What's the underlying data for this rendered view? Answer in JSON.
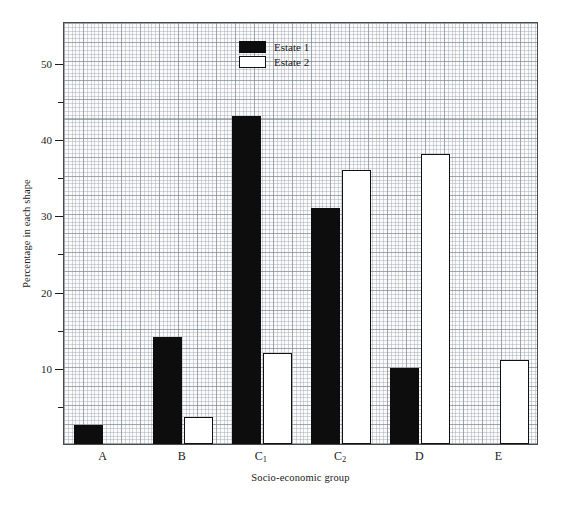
{
  "chart_data": {
    "type": "bar",
    "title": "",
    "xlabel": "Socio-economic group",
    "ylabel": "Percentage in each shape",
    "categories": [
      "A",
      "B",
      "C1",
      "C2",
      "D",
      "E"
    ],
    "category_labels": [
      {
        "base": "A",
        "sub": ""
      },
      {
        "base": "B",
        "sub": ""
      },
      {
        "base": "C",
        "sub": "1"
      },
      {
        "base": "C",
        "sub": "2"
      },
      {
        "base": "D",
        "sub": ""
      },
      {
        "base": "E",
        "sub": ""
      }
    ],
    "series": [
      {
        "name": "Estate 1",
        "color": "#0d0d0d",
        "fill": "solid",
        "values": [
          2.5,
          14,
          43,
          31,
          10,
          0
        ]
      },
      {
        "name": "Estate 2",
        "color": "#ffffff",
        "fill": "outline",
        "values": [
          0,
          3.5,
          12,
          36,
          38,
          11
        ]
      }
    ],
    "ylim": [
      0,
      55.5
    ],
    "ytick_major": [
      10,
      20,
      30,
      40,
      50
    ],
    "ytick_minor": [
      5,
      15,
      25,
      35,
      45
    ],
    "ytick_labels": [
      "10",
      "20",
      "30",
      "40",
      "50"
    ],
    "grid": true,
    "grid_style": "graph-paper-fine-with-major-every-5",
    "legend_position": "top-center"
  },
  "legend": {
    "items": [
      {
        "label": "Estate 1",
        "style": "solid-black"
      },
      {
        "label": "Estate 2",
        "style": "white-outline"
      }
    ]
  }
}
